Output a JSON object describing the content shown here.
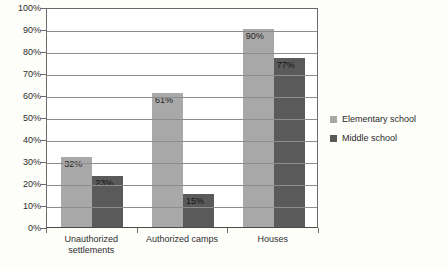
{
  "chart_data": {
    "type": "bar",
    "title": "",
    "subtitle": "",
    "xlabel": "",
    "ylabel": "",
    "categories": [
      "Unauthorized settlements",
      "Authorized camps",
      "Houses"
    ],
    "series": [
      {
        "name": "Elementary school",
        "color": "#a8a8a8",
        "values": [
          32,
          61,
          90
        ],
        "value_labels": [
          "32%",
          "61%",
          "90%"
        ]
      },
      {
        "name": "Middle school",
        "color": "#5a5a5a",
        "values": [
          23,
          15,
          77
        ],
        "value_labels": [
          "23%",
          "15%",
          "77%"
        ]
      }
    ],
    "ylim": [
      0,
      100
    ],
    "y_ticks": [
      0,
      10,
      20,
      30,
      40,
      50,
      60,
      70,
      80,
      90,
      100
    ],
    "y_tick_labels": [
      "0%",
      "10%",
      "20%",
      "30%",
      "40%",
      "50%",
      "60%",
      "70%",
      "80%",
      "90%",
      "100%"
    ],
    "grid": true,
    "legend_position": "right"
  },
  "legend": {
    "items": [
      {
        "label": "Elementary school",
        "color": "#a8a8a8"
      },
      {
        "label": "Middle school",
        "color": "#5a5a5a"
      }
    ]
  },
  "axes": {
    "y_tick_labels": [
      "100%",
      "90%",
      "80%",
      "70%",
      "60%",
      "50%",
      "40%",
      "30%",
      "20%",
      "10%",
      "0%"
    ],
    "x_tick_labels": [
      "Unauthorized settlements",
      "Authorized camps",
      "Houses"
    ]
  },
  "colors": {
    "series_light": "#a8a8a8",
    "series_dark": "#5a5a5a",
    "axis": "#6b6b6b",
    "grid": "#8d8d8d",
    "background": "#fdfdfa"
  }
}
